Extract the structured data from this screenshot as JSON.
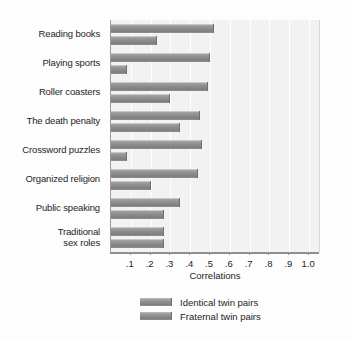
{
  "chart_data": {
    "type": "bar",
    "orientation": "horizontal",
    "title": "",
    "xlabel": "Correlations",
    "ylabel": "",
    "xlim": [
      0,
      1.05
    ],
    "grid": true,
    "legend_position": "bottom",
    "xticks": [
      ".1",
      ".2",
      ".3",
      ".4",
      ".5",
      ".6",
      ".7",
      ".8",
      ".9",
      "1.0"
    ],
    "xtick_values": [
      0.1,
      0.2,
      0.3,
      0.4,
      0.5,
      0.6,
      0.7,
      0.8,
      0.9,
      1.0
    ],
    "categories": [
      "Reading books",
      "Playing sports",
      "Roller coasters",
      "The death penalty",
      "Crossword puzzles",
      "Organized religion",
      "Public speaking",
      "Traditional sex roles"
    ],
    "category_lines": [
      [
        "Reading books"
      ],
      [
        "Playing sports"
      ],
      [
        "Roller coasters"
      ],
      [
        "The death penalty"
      ],
      [
        "Crossword puzzles"
      ],
      [
        "Organized religion"
      ],
      [
        "Public speaking"
      ],
      [
        "Traditional",
        "sex roles"
      ]
    ],
    "series": [
      {
        "name": "Identical twin pairs",
        "values": [
          0.52,
          0.5,
          0.49,
          0.45,
          0.46,
          0.44,
          0.35,
          0.27
        ]
      },
      {
        "name": "Fraternal twin pairs",
        "values": [
          0.23,
          0.08,
          0.3,
          0.35,
          0.08,
          0.2,
          0.27,
          0.27
        ]
      }
    ]
  },
  "legend": {
    "items": [
      {
        "label": "Identical twin pairs"
      },
      {
        "label": "Fraternal twin pairs"
      }
    ]
  },
  "colors": {
    "bar_fill": "#8d8d8d",
    "bar_edge": "#6f6f6f",
    "plot_background": "#f2f2f2",
    "gridline": "#ffffff",
    "axis": "#8f8f8f",
    "text": "#1d1d1d"
  }
}
